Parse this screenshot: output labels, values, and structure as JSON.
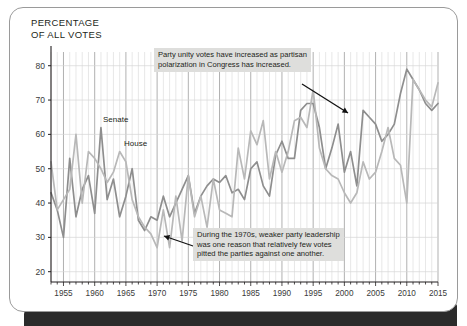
{
  "card": {
    "title": "PERCENTAGE\nOF ALL VOTES"
  },
  "annotations": {
    "top": "Party unity votes have increased as partisan\npolarization in Congress has increased.",
    "bottom": "During the 1970s, weaker party leadership\nwas one reason that relatively few votes\npitted the parties against one another."
  },
  "series_labels": {
    "senate": "Senate",
    "house": "House"
  },
  "colors": {
    "senate_line": "#8e8e8e",
    "house_line": "#b8b8b8",
    "axis": "#231f20",
    "gridline_minor": "#d6d6d6",
    "gridline_major": "#a8a8a8",
    "annotation_bg": "#dededc",
    "bottom_bar": "#2b2b2b"
  },
  "chart_data": {
    "type": "line",
    "title": "PERCENTAGE OF ALL VOTES",
    "xlabel": "",
    "ylabel": "PERCENTAGE OF ALL VOTES",
    "xlim": [
      1953,
      2015
    ],
    "ylim": [
      17,
      84
    ],
    "grid": true,
    "grid_x_minor_step": 1,
    "grid_x_major_step": 5,
    "legend_position": "inline-labels",
    "yticks": [
      20,
      30,
      40,
      50,
      60,
      70,
      80
    ],
    "xticks": [
      1955,
      1960,
      1965,
      1970,
      1975,
      1980,
      1985,
      1990,
      1995,
      2000,
      2005,
      2010,
      2015
    ],
    "x": [
      1953,
      1954,
      1955,
      1956,
      1957,
      1958,
      1959,
      1960,
      1961,
      1962,
      1963,
      1964,
      1965,
      1966,
      1967,
      1968,
      1969,
      1970,
      1971,
      1972,
      1973,
      1974,
      1975,
      1976,
      1977,
      1978,
      1979,
      1980,
      1981,
      1982,
      1983,
      1984,
      1985,
      1986,
      1987,
      1988,
      1989,
      1990,
      1991,
      1992,
      1993,
      1994,
      1995,
      1996,
      1997,
      1998,
      1999,
      2000,
      2001,
      2002,
      2003,
      2004,
      2005,
      2006,
      2007,
      2008,
      2009,
      2010,
      2011,
      2012,
      2013,
      2014,
      2015
    ],
    "series": [
      {
        "name": "Senate",
        "color": "#8e8e8e",
        "values": [
          43,
          38,
          30,
          53,
          36,
          44,
          48,
          37,
          62,
          41,
          47,
          36,
          42,
          50,
          35,
          32,
          36,
          35,
          42,
          36,
          40,
          44,
          48,
          37,
          42,
          45,
          47,
          46,
          48,
          43,
          44,
          41,
          50,
          52,
          45,
          42,
          54,
          58,
          53,
          53,
          67,
          69,
          69,
          62,
          50,
          56,
          63,
          49,
          55,
          45,
          67,
          65,
          63,
          58,
          60,
          63,
          72,
          79,
          76,
          73,
          69,
          67,
          69
        ]
      },
      {
        "name": "House",
        "color": "#b8b8b8",
        "values": [
          52,
          38,
          41,
          44,
          60,
          40,
          55,
          53,
          50,
          46,
          49,
          55,
          52,
          41,
          36,
          33,
          31,
          27,
          38,
          27,
          42,
          29,
          48,
          36,
          42,
          33,
          47,
          38,
          37,
          36,
          56,
          47,
          61,
          57,
          64,
          47,
          55,
          49,
          55,
          64,
          65,
          62,
          73,
          56,
          50,
          48,
          47,
          43,
          40,
          43,
          52,
          47,
          49,
          55,
          62,
          53,
          51,
          40,
          76,
          73,
          70,
          68,
          75
        ]
      }
    ],
    "callouts": [
      {
        "text": "Party unity votes have increased as partisan polarization in Congress has increased.",
        "points_to_year": 2003,
        "points_to_value": 67
      },
      {
        "text": "During the 1970s, weaker party leadership was one reason that relatively few votes pitted the parties against one another.",
        "points_to_year": 1972,
        "points_to_value": 27
      }
    ]
  }
}
